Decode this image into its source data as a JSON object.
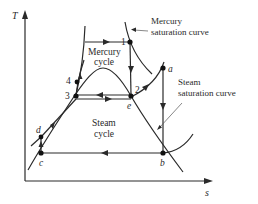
{
  "diagram": {
    "type": "T-s diagram",
    "axes": {
      "y_label": "T",
      "x_label": "s"
    },
    "cycles": [
      {
        "name": "mercury",
        "label_line1": "Mercury",
        "label_line2": "cycle"
      },
      {
        "name": "steam",
        "label_line1": "Steam",
        "label_line2": "cycle"
      }
    ],
    "annotations": {
      "mercury_sat_line1": "Mercury",
      "mercury_sat_line2": "saturation curve",
      "steam_sat_line1": "Steam",
      "steam_sat_line2": "saturation curve"
    },
    "points": {
      "p1": "1",
      "p2": "2",
      "p3": "3",
      "p4": "4",
      "a": "a",
      "b": "b",
      "c": "c",
      "d": "d",
      "e": "e"
    }
  }
}
